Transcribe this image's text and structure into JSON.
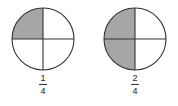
{
  "figures": [
    {
      "id": "one-fourth",
      "parts_total": 4,
      "parts_shaded": 1,
      "shaded_quadrants": [
        "top-left"
      ],
      "fraction": {
        "numerator": "1",
        "denominator": "4"
      }
    },
    {
      "id": "two-fourths",
      "parts_total": 4,
      "parts_shaded": 2,
      "shaded_quadrants": [
        "top-left",
        "bottom-left"
      ],
      "fraction": {
        "numerator": "2",
        "denominator": "4"
      }
    }
  ],
  "colors": {
    "shade": "#a6a6a6",
    "stroke": "#333333",
    "background": "#ffffff"
  }
}
